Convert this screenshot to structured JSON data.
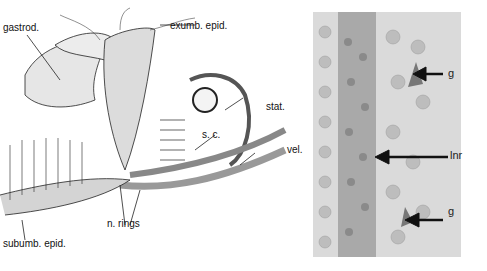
{
  "figure": {
    "left_panel": {
      "description": "Line drawing of hydromedusan bell margin section",
      "labels": {
        "gastrod": "gastrod.",
        "exumb_epid": "exumb. epid.",
        "stat": "stat.",
        "s_c": "s. c.",
        "vel": "vel.",
        "n_rings": "n. rings",
        "subumb_epid": "subumb. epid."
      }
    },
    "right_panel": {
      "description": "Micrograph of nerve ring with ganglion cells",
      "labels": {
        "g_top": "g",
        "lnr": "lnr",
        "g_bottom": "g"
      }
    }
  }
}
